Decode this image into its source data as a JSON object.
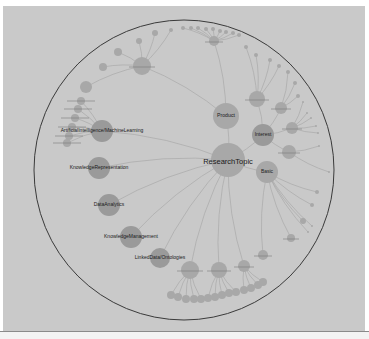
{
  "diagram": {
    "type": "radial-tree",
    "boundary": {
      "cx": 184,
      "cy": 170,
      "r": 150,
      "stroke": "#3a3a3a"
    },
    "colors": {
      "background": "#c9c9c9",
      "node": "#a8a8a8",
      "node_dark": "#9a9a9a",
      "link": "#a9a9a9",
      "label": "#1a1a1a"
    },
    "root": {
      "id": "root",
      "label": "ResearchTopic",
      "x": 228,
      "y": 160,
      "r": 17
    },
    "nodes": [
      {
        "id": "product",
        "label": "Product",
        "x": 226,
        "y": 116,
        "r": 13,
        "parent": "root",
        "size": "med"
      },
      {
        "id": "interest",
        "label": "Interest",
        "x": 263,
        "y": 135,
        "r": 11,
        "parent": "root",
        "size": "small",
        "dark": true
      },
      {
        "id": "basic",
        "label": "Basic",
        "x": 267,
        "y": 172,
        "r": 11,
        "parent": "root",
        "size": "small"
      },
      {
        "id": "aiml",
        "label": "ArtificialIntelligence/MachineLearning",
        "x": 102,
        "y": 131,
        "r": 11,
        "parent": "root",
        "size": "small",
        "dark": true
      },
      {
        "id": "kr",
        "label": "KnowledgeRepresentation",
        "x": 99,
        "y": 168,
        "r": 11,
        "parent": "root",
        "size": "small",
        "dark": true
      },
      {
        "id": "da",
        "label": "DataAnalytics",
        "x": 109,
        "y": 205,
        "r": 11,
        "parent": "root",
        "size": "small",
        "dark": true
      },
      {
        "id": "km",
        "label": "KnowledgeManagement",
        "x": 131,
        "y": 237,
        "r": 11,
        "parent": "root",
        "size": "small",
        "dark": true
      },
      {
        "id": "ld",
        "label": "LinkedData/Ontologies",
        "x": 160,
        "y": 258,
        "r": 10,
        "parent": "root",
        "size": "small",
        "dark": true
      },
      {
        "id": "b1",
        "label": "",
        "x": 190,
        "y": 270,
        "r": 9,
        "parent": "root"
      },
      {
        "id": "b2",
        "label": "",
        "x": 219,
        "y": 270,
        "r": 8,
        "parent": "root"
      },
      {
        "id": "b3",
        "label": "",
        "x": 244,
        "y": 266,
        "r": 6,
        "parent": "root"
      },
      {
        "id": "i1",
        "label": "",
        "x": 257,
        "y": 99,
        "r": 8,
        "parent": "interest"
      },
      {
        "id": "i2",
        "label": "",
        "x": 281,
        "y": 108,
        "r": 6,
        "parent": "interest"
      },
      {
        "id": "i3",
        "label": "",
        "x": 292,
        "y": 128,
        "r": 6,
        "parent": "interest"
      },
      {
        "id": "i4",
        "label": "",
        "x": 289,
        "y": 152,
        "r": 7,
        "parent": "interest"
      },
      {
        "id": "p1",
        "label": "",
        "x": 142,
        "y": 66,
        "r": 9,
        "parent": "product"
      },
      {
        "id": "p2",
        "label": "",
        "x": 214,
        "y": 41,
        "r": 5,
        "parent": "product"
      },
      {
        "id": "c1",
        "label": "",
        "x": 263,
        "y": 255,
        "r": 5,
        "parent": "basic"
      },
      {
        "id": "c2",
        "label": "",
        "x": 291,
        "y": 238,
        "r": 4,
        "parent": "basic"
      }
    ],
    "leaves": {
      "p1": [
        [
          86,
          87,
          6
        ],
        [
          103,
          67,
          4
        ],
        [
          118,
          52,
          4
        ],
        [
          139,
          41,
          3
        ],
        [
          155,
          33,
          3
        ],
        [
          171,
          30,
          2
        ]
      ],
      "p2": [
        [
          183,
          28,
          2
        ],
        [
          191,
          28,
          2
        ],
        [
          198,
          28,
          2
        ],
        [
          206,
          29,
          2
        ],
        [
          213,
          29,
          2
        ],
        [
          220,
          31,
          2
        ],
        [
          226,
          32,
          2
        ],
        [
          233,
          33,
          2
        ],
        [
          239,
          35,
          2
        ]
      ],
      "i1": [
        [
          246,
          47,
          2
        ],
        [
          256,
          55,
          2
        ],
        [
          270,
          60,
          2
        ],
        [
          279,
          66,
          2
        ]
      ],
      "i2": [
        [
          288,
          72,
          2
        ],
        [
          295,
          83,
          2
        ],
        [
          298,
          96,
          2
        ]
      ],
      "i3": [
        [
          303,
          102,
          1
        ],
        [
          307,
          113,
          1
        ],
        [
          311,
          118,
          1
        ],
        [
          316,
          126,
          1
        ],
        [
          318,
          133,
          1
        ]
      ],
      "i4": [
        [
          319,
          146,
          1
        ],
        [
          329,
          172,
          1
        ]
      ],
      "basic": [
        [
          317,
          192,
          2
        ],
        [
          312,
          205,
          2
        ],
        [
          303,
          221,
          3
        ],
        [
          312,
          226,
          1
        ],
        [
          308,
          232,
          1
        ]
      ],
      "b1": [
        [
          171,
          295,
          4
        ],
        [
          178,
          297,
          4
        ],
        [
          186,
          299,
          4
        ],
        [
          194,
          299,
          4
        ],
        [
          201,
          299,
          4
        ]
      ],
      "b2": [
        [
          208,
          298,
          4
        ],
        [
          215,
          297,
          4
        ],
        [
          222,
          295,
          4
        ],
        [
          229,
          293,
          4
        ],
        [
          236,
          292,
          4
        ]
      ],
      "b3": [
        [
          244,
          290,
          4
        ],
        [
          251,
          288,
          4
        ],
        [
          258,
          285,
          4
        ],
        [
          263,
          282,
          4
        ]
      ],
      "aiml": [
        [
          81,
          101,
          4
        ],
        [
          78,
          109,
          4
        ],
        [
          75,
          118,
          4
        ],
        [
          72,
          127,
          4
        ],
        [
          69,
          136,
          4
        ],
        [
          67,
          143,
          4
        ]
      ]
    }
  }
}
